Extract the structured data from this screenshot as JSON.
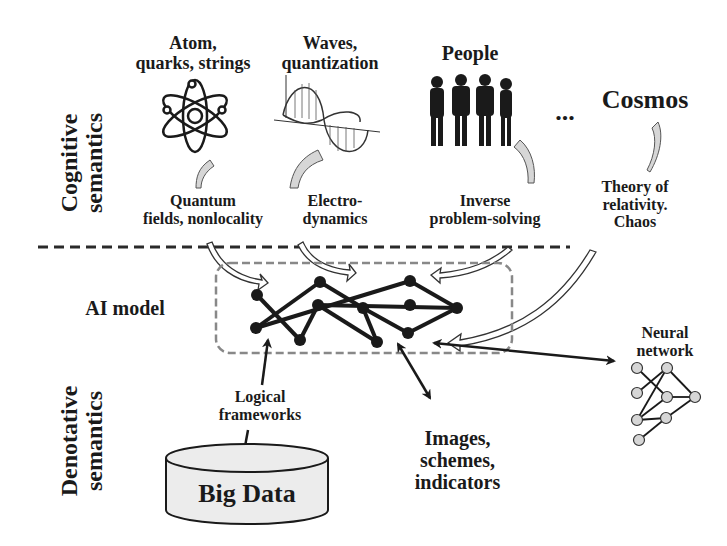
{
  "sections": {
    "cognitive": "Cognitive\nsemantics",
    "cognitive_line1": "Cognitive",
    "cognitive_line2": "semantics",
    "denotative_line1": "Denotative",
    "denotative_line2": "semantics"
  },
  "top_concepts": [
    {
      "line1": "Atom,",
      "line2": "quarks, strings",
      "icon": "atom-icon"
    },
    {
      "line1": "Waves,",
      "line2": "quantization",
      "icon": "wave-icon"
    },
    {
      "line1": "People",
      "line2": "",
      "icon": "people-icon"
    },
    {
      "line1": "Cosmos",
      "line2": "",
      "icon": ""
    }
  ],
  "ellipsis": "...",
  "theories": [
    {
      "line1": "Quantum",
      "line2": "fields, nonlocality"
    },
    {
      "line1": "Electro-",
      "line2": "dynamics"
    },
    {
      "line1": "Inverse",
      "line2": "problem-solving"
    },
    {
      "line1": "Theory of",
      "line2": "relativity.",
      "line3": "Chaos"
    }
  ],
  "ai_model": {
    "label": "AI model"
  },
  "neural_network": {
    "line1": "Neural",
    "line2": "network"
  },
  "logical_frameworks": {
    "line1": "Logical",
    "line2": "frameworks"
  },
  "big_data": {
    "label": "Big Data"
  },
  "outputs": {
    "line1": "Images,",
    "line2": "schemes,",
    "line3": "indicators"
  },
  "colors": {
    "ink": "#1a1a1a",
    "fill_gray": "#d6d6d6",
    "dash": "#777777",
    "background": "#ffffff"
  }
}
